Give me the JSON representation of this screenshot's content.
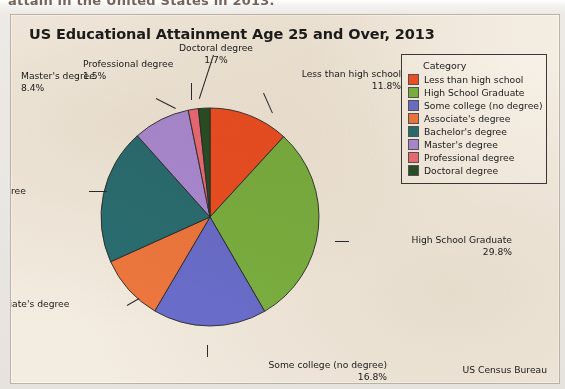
{
  "document": {
    "clipped_heading": "attain in the United States in 2013."
  },
  "chart": {
    "title": "US Educational Attainment Age 25 and Over, 2013",
    "source": "US Census Bureau"
  },
  "legend": {
    "title": "Category"
  },
  "chart_data": {
    "type": "pie",
    "title": "US Educational Attainment Age 25 and Over, 2013",
    "xlabel": "",
    "ylabel": "",
    "legend_title": "Category",
    "legend_position": "right",
    "source": "US Census Bureau",
    "start_angle_deg": 0,
    "direction": "clockwise",
    "categories": [
      "Less than high school",
      "High School Graduate",
      "Some college (no degree)",
      "Associate's degree",
      "Bachelor's degree",
      "Master's degree",
      "Professional degree",
      "Doctoral degree"
    ],
    "values": [
      11.8,
      29.8,
      16.8,
      9.8,
      20.1,
      8.4,
      1.5,
      1.7
    ],
    "value_labels": [
      "11.8%",
      "29.8%",
      "16.8%",
      "9.8%",
      "20.1%",
      "8.4%",
      "1.5%",
      "1.7%"
    ],
    "colors": [
      "#ef5123",
      "#7cb342",
      "#6b6fd0",
      "#f0793f",
      "#2b6f74",
      "#ad8ddb",
      "#ef6d7a",
      "#2b5026"
    ],
    "slices": [
      {
        "label": "Less than high school",
        "value": 11.8,
        "value_label": "11.8%",
        "color": "#ef5123"
      },
      {
        "label": "High School Graduate",
        "value": 29.8,
        "value_label": "29.8%",
        "color": "#7cb342"
      },
      {
        "label": "Some college (no degree)",
        "value": 16.8,
        "value_label": "16.8%",
        "color": "#6b6fd0"
      },
      {
        "label": "Associate's degree",
        "value": 9.8,
        "value_label": "9.8%",
        "color": "#f0793f"
      },
      {
        "label": "Bachelor's degree",
        "value": 20.1,
        "value_label": "20.1%",
        "color": "#2b6f74"
      },
      {
        "label": "Master's degree",
        "value": 8.4,
        "value_label": "8.4%",
        "color": "#ad8ddb"
      },
      {
        "label": "Professional degree",
        "value": 1.5,
        "value_label": "1.5%",
        "color": "#ef6d7a"
      },
      {
        "label": "Doctoral degree",
        "value": 1.7,
        "value_label": "1.7%",
        "color": "#2b5026"
      }
    ]
  }
}
